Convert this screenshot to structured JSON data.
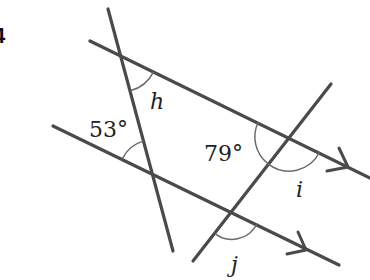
{
  "question": {
    "number": "4"
  },
  "diagram": {
    "colors": {
      "line": "#4a4a4a",
      "arc": "#6a6a6a",
      "text": "#222222",
      "background": "#ffffff"
    },
    "parallel_lines": [
      {
        "name": "upper-parallel",
        "marker": "single arrow"
      },
      {
        "name": "lower-parallel",
        "marker": "single arrow"
      }
    ],
    "transversals": [
      {
        "name": "left-transversal"
      },
      {
        "name": "right-transversal"
      }
    ],
    "angles": {
      "h": "h",
      "given_53": "53°",
      "given_79": "79°",
      "i": "i",
      "j": "j"
    }
  }
}
